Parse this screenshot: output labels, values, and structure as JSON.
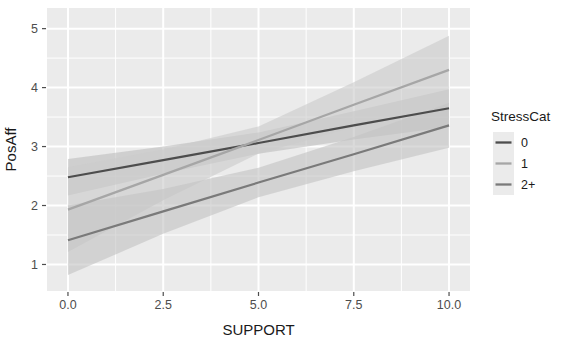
{
  "chart_data": {
    "type": "line",
    "title": "",
    "xlabel": "SUPPORT",
    "ylabel": "PosAff",
    "xlim": [
      -0.55,
      10.55
    ],
    "ylim": [
      0.55,
      5.35
    ],
    "xticks": [
      0.0,
      2.5,
      5.0,
      7.5,
      10.0
    ],
    "xtick_labels": [
      "0.0",
      "2.5",
      "5.0",
      "7.5",
      "10.0"
    ],
    "yticks": [
      1,
      2,
      3,
      4,
      5
    ],
    "ytick_labels": [
      "1",
      "2",
      "3",
      "4",
      "5"
    ],
    "grid": true,
    "grid_color": "#ffffff",
    "panel_background": "#ebebeb",
    "legend": {
      "title": "StressCat",
      "position": "right",
      "entries": [
        {
          "label": "0",
          "color": "#4d4d4d"
        },
        {
          "label": "1",
          "color": "#a6a6a6"
        },
        {
          "label": "2+",
          "color": "#7a7a7a"
        }
      ]
    },
    "series": [
      {
        "name": "0",
        "color": "#4d4d4d",
        "band_color": "#bfbfbf",
        "x": [
          0.0,
          2.5,
          5.0,
          7.5,
          10.0
        ],
        "y": [
          2.48,
          2.77,
          3.06,
          3.36,
          3.65
        ],
        "ci_lower": [
          2.17,
          2.54,
          2.88,
          3.12,
          3.33
        ],
        "ci_upper": [
          2.79,
          3.0,
          3.24,
          3.6,
          3.97
        ]
      },
      {
        "name": "1",
        "color": "#a6a6a6",
        "band_color": "#cccccc",
        "x": [
          0.0,
          2.5,
          5.0,
          7.5,
          10.0
        ],
        "y": [
          1.93,
          2.52,
          3.11,
          3.71,
          4.3
        ],
        "ci_lower": [
          1.21,
          2.09,
          2.88,
          3.33,
          3.72
        ],
        "ci_upper": [
          2.65,
          2.95,
          3.34,
          4.09,
          4.88
        ]
      },
      {
        "name": "2+",
        "color": "#7a7a7a",
        "band_color": "#c4c4c4",
        "x": [
          0.0,
          2.5,
          5.0,
          7.5,
          10.0
        ],
        "y": [
          1.41,
          1.9,
          2.39,
          2.87,
          3.36
        ],
        "ci_lower": [
          0.82,
          1.52,
          2.14,
          2.58,
          2.98
        ],
        "ci_upper": [
          2.0,
          2.28,
          2.64,
          3.16,
          3.74
        ]
      }
    ]
  }
}
